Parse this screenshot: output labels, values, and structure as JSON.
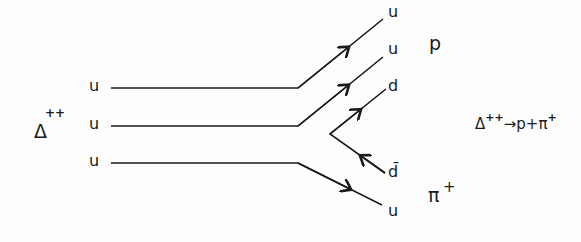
{
  "diagram": {
    "type": "quark-flow",
    "initial_particle": {
      "symbol": "Δ",
      "charge": "++"
    },
    "initial_quarks": [
      "u",
      "u",
      "u"
    ],
    "final_quarks": [
      "u",
      "u",
      "d",
      "d̄",
      "u"
    ],
    "final_quark_overline_index": 3,
    "products": [
      {
        "symbol": "p",
        "charge": ""
      },
      {
        "symbol": "π",
        "charge": "+"
      }
    ],
    "reaction": {
      "lhs": "Δ",
      "lhs_charge": "++",
      "arrow": "→",
      "rhs_1": "p",
      "plus": "+",
      "rhs_2": "π",
      "rhs_2_charge": "+"
    },
    "line_color": "#1a1a1a"
  }
}
